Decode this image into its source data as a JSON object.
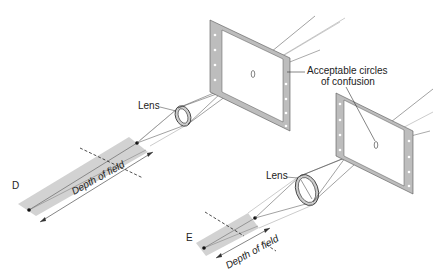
{
  "figure": {
    "labels": {
      "lens_1": "Lens",
      "lens_2": "Lens",
      "circles_line1": "Acceptable circles",
      "circles_line2": "of confusion",
      "dof_1": "Depth of field",
      "dof_2": "Depth of field",
      "panel_d": "D",
      "panel_e": "E"
    },
    "colors": {
      "strip": "#cfcfcf",
      "frame": "#bdbdbd",
      "line": "#333333"
    }
  }
}
